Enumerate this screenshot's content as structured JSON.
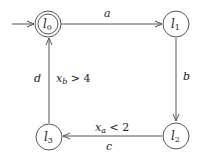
{
  "diagram": {
    "type": "timed-automaton",
    "locations": [
      {
        "id": "l0",
        "label": "l",
        "sub": "0",
        "initial": true,
        "cx": 48,
        "cy": 24
      },
      {
        "id": "l1",
        "label": "l",
        "sub": "1",
        "initial": false,
        "cx": 176,
        "cy": 24
      },
      {
        "id": "l2",
        "label": "l",
        "sub": "2",
        "initial": false,
        "cx": 176,
        "cy": 136
      },
      {
        "id": "l3",
        "label": "l",
        "sub": "3",
        "initial": false,
        "cx": 49,
        "cy": 137
      }
    ],
    "edges": [
      {
        "from": "l0",
        "to": "l1",
        "action": "a",
        "guard": ""
      },
      {
        "from": "l1",
        "to": "l2",
        "action": "b",
        "guard": ""
      },
      {
        "from": "l2",
        "to": "l3",
        "action": "c",
        "guard_var": "x",
        "guard_sub": "a",
        "guard_rest": " < 2"
      },
      {
        "from": "l3",
        "to": "l0",
        "action": "d",
        "guard_var": "x",
        "guard_sub": "b",
        "guard_rest": " > 4"
      }
    ]
  }
}
